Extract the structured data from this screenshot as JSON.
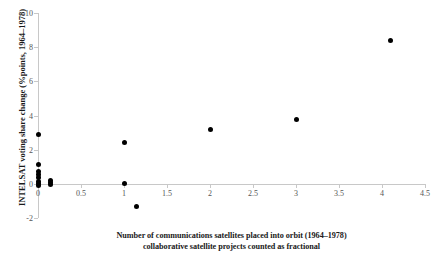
{
  "chart_data": {
    "type": "scatter",
    "title": "",
    "xlabel": "Number of communications satellites placed into orbit (1964–1978)",
    "xlabel_line2": "collaborative satellite projects counted as fractional",
    "ylabel": "INTELSAT voting share change (%points, 1964–1978)",
    "xlim": [
      0,
      4.5
    ],
    "ylim": [
      -2,
      10
    ],
    "xticks": [
      0,
      0.5,
      1,
      1.5,
      2,
      2.5,
      3,
      3.5,
      4,
      4.5
    ],
    "xtick_labels": [
      "0",
      "0.5",
      "1",
      "1.5",
      "2",
      "2.5",
      "3",
      "3.5",
      "4",
      "4.5"
    ],
    "yticks": [
      -2,
      0,
      2,
      4,
      6,
      8,
      10
    ],
    "ytick_labels": [
      "-2",
      "0",
      "2",
      "4",
      "6",
      "8",
      "10"
    ],
    "grid": false,
    "legend": false,
    "marker_color": "#000000",
    "axis_color": "#c8c8c8",
    "points": [
      {
        "x": 0.0,
        "y": 2.9
      },
      {
        "x": 0.0,
        "y": 1.15
      },
      {
        "x": 0.0,
        "y": 0.75
      },
      {
        "x": 0.0,
        "y": 0.55
      },
      {
        "x": 0.0,
        "y": 0.35
      },
      {
        "x": 0.0,
        "y": 0.15
      },
      {
        "x": 0.0,
        "y": 0.0
      },
      {
        "x": 0.0,
        "y": -0.1
      },
      {
        "x": 0.15,
        "y": 0.2
      },
      {
        "x": 0.15,
        "y": 0.05
      },
      {
        "x": 0.15,
        "y": -0.05
      },
      {
        "x": 1.0,
        "y": 2.4
      },
      {
        "x": 1.0,
        "y": 0.0
      },
      {
        "x": 1.15,
        "y": -1.3
      },
      {
        "x": 2.0,
        "y": 3.2
      },
      {
        "x": 3.0,
        "y": 3.75
      },
      {
        "x": 4.1,
        "y": 8.4
      }
    ]
  }
}
